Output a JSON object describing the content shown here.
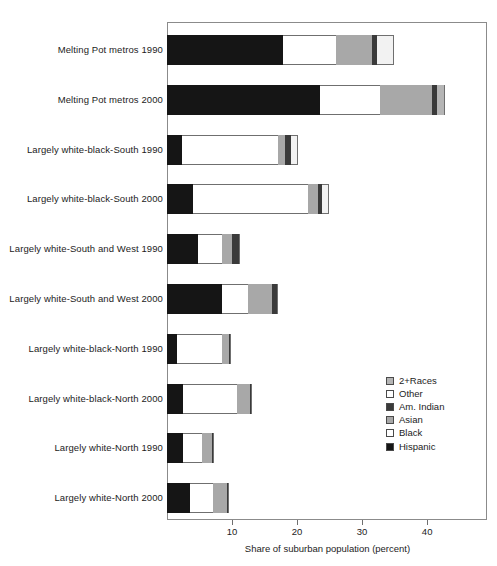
{
  "chart_data": {
    "type": "bar",
    "orientation": "horizontal",
    "stacked": true,
    "title": "",
    "xlabel": "Share of suburban population (percent)",
    "ylabel": "",
    "xlim": [
      0,
      49.2
    ],
    "xticks": [
      10,
      20,
      30,
      40
    ],
    "xtick_labels": [
      "10",
      "20",
      "30",
      "40"
    ],
    "grid": false,
    "legend_position": "inside-right",
    "legend_order": [
      "2+Races",
      "Other",
      "Am. Indian",
      "Asian",
      "Black",
      "Hispanic"
    ],
    "stack_order_from_axis": [
      "Hispanic",
      "Black",
      "Asian",
      "Am. Indian",
      "Other",
      "2+Races"
    ],
    "categories": [
      "Melting Pot metros 1990",
      "Melting Pot metros 2000",
      "Largely white-black-South 1990",
      "Largely white-black-South 2000",
      "Largely white-South and West 1990",
      "Largely white-South and West 2000",
      "Largely white-black-North 1990",
      "Largely white-black-North 2000",
      "Largely white-North 1990",
      "Largely white-North 2000"
    ],
    "series": [
      {
        "name": "Hispanic",
        "color": "#151515",
        "values": [
          17.8,
          23.5,
          2.3,
          4.0,
          4.8,
          8.5,
          1.5,
          2.5,
          2.5,
          3.5
        ]
      },
      {
        "name": "Black",
        "color": "#ffffff",
        "values": [
          8.2,
          9.2,
          14.8,
          17.7,
          3.7,
          4.0,
          6.9,
          8.3,
          2.9,
          3.5
        ]
      },
      {
        "name": "Asian",
        "color": "#a8a8a8",
        "values": [
          5.5,
          8.0,
          1.1,
          1.5,
          1.5,
          3.7,
          1.2,
          2.0,
          1.5,
          2.2
        ]
      },
      {
        "name": "Am. Indian",
        "color": "#3a3a3a",
        "values": [
          0.8,
          0.8,
          0.8,
          0.6,
          1.2,
          0.9,
          0.3,
          0.3,
          0.3,
          0.3
        ]
      },
      {
        "name": "Other",
        "color": "#f2f2f2",
        "values": [
          2.6,
          0.0,
          1.2,
          0.9,
          0.0,
          0.0,
          0.0,
          0.0,
          0.0,
          0.0
        ]
      },
      {
        "name": "2+Races",
        "color": "#b5b5b5",
        "values": [
          0.0,
          1.2,
          0.0,
          0.2,
          0.0,
          0.0,
          0.0,
          0.0,
          0.0,
          0.0
        ]
      }
    ],
    "totals": [
      35.1,
      42.2,
      19.4,
      24.8,
      11.2,
      17.1,
      9.9,
      13.1,
      7.2,
      9.5
    ]
  },
  "legend": {
    "items": [
      {
        "label": "2+Races",
        "swatch": "races2"
      },
      {
        "label": "Other",
        "swatch": "other"
      },
      {
        "label": "Am. Indian",
        "swatch": "amindian"
      },
      {
        "label": "Asian",
        "swatch": "asian"
      },
      {
        "label": "Black",
        "swatch": "black"
      },
      {
        "label": "Hispanic",
        "swatch": "hispanic"
      }
    ]
  },
  "axis": {
    "x_title": "Share of suburban population (percent)",
    "ticks": [
      "10",
      "20",
      "30",
      "40"
    ]
  }
}
